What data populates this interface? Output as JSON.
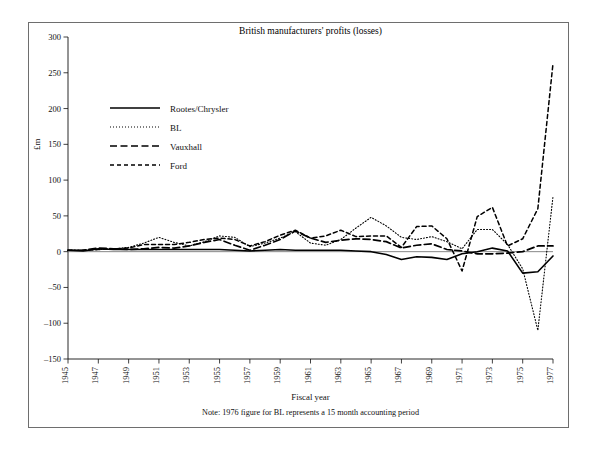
{
  "figure": {
    "border_color": "#6e6e6e",
    "background": "#ffffff"
  },
  "chart_data": {
    "type": "line",
    "title": "British manufacturers' profits (losses)",
    "xlabel": "Fiscal year",
    "ylabel": "£m",
    "note": "Note: 1976 figure for BL represents a 15 month accounting period",
    "grid": false,
    "legend_position": "upper-left",
    "xlim": [
      1945,
      1977
    ],
    "ylim": [
      -150,
      300
    ],
    "ytick_values": [
      300,
      250,
      200,
      150,
      100,
      50,
      0,
      -50,
      -100,
      -150
    ],
    "ytick_labels": [
      "300",
      "250",
      "200",
      "150",
      "100",
      "50",
      "0",
      "–50",
      "–100",
      "–150"
    ],
    "xtick_values": [
      1945,
      1947,
      1949,
      1951,
      1953,
      1955,
      1957,
      1959,
      1961,
      1963,
      1965,
      1967,
      1969,
      1971,
      1973,
      1975,
      1977
    ],
    "xtick_labels": [
      "1945",
      "1947",
      "1949",
      "1951",
      "1953",
      "1955",
      "1957",
      "1959",
      "1961",
      "1963",
      "1965",
      "1967",
      "1969",
      "1971",
      "1973",
      "1975",
      "1977"
    ],
    "x": [
      1945,
      1946,
      1947,
      1948,
      1949,
      1950,
      1951,
      1952,
      1953,
      1954,
      1955,
      1956,
      1957,
      1958,
      1959,
      1960,
      1961,
      1962,
      1963,
      1964,
      1965,
      1966,
      1967,
      1968,
      1969,
      1970,
      1971,
      1972,
      1973,
      1974,
      1975,
      1976,
      1977
    ],
    "series": [
      {
        "name": "Rootes/Chrysler",
        "style": "solid",
        "color": "#000000",
        "values": [
          2,
          1,
          4,
          3,
          3,
          3,
          3,
          3,
          3,
          3,
          3,
          2,
          1,
          2,
          3,
          2,
          2,
          2,
          2,
          1,
          0,
          -4,
          -11,
          -7,
          -8,
          -11,
          -3,
          0,
          5,
          1,
          -30,
          -28,
          -6
        ]
      },
      {
        "name": "BL",
        "style": "dotted",
        "color": "#000000",
        "values": [
          2,
          2,
          3,
          4,
          6,
          12,
          20,
          13,
          8,
          14,
          22,
          20,
          7,
          12,
          19,
          28,
          12,
          9,
          17,
          33,
          48,
          36,
          20,
          17,
          21,
          14,
          4,
          31,
          31,
          10,
          -24,
          -110,
          77
        ]
      },
      {
        "name": "Vauxhall",
        "style": "longdash",
        "color": "#000000",
        "values": [
          2,
          2,
          5,
          4,
          3,
          4,
          6,
          5,
          8,
          13,
          17,
          9,
          2,
          9,
          17,
          29,
          19,
          13,
          16,
          18,
          17,
          14,
          5,
          9,
          11,
          3,
          1,
          -3,
          -3,
          -2,
          0,
          8,
          8
        ]
      },
      {
        "name": "Ford",
        "style": "dashed",
        "color": "#000000",
        "values": [
          2,
          2,
          3,
          4,
          5,
          10,
          10,
          10,
          13,
          17,
          19,
          17,
          8,
          14,
          23,
          30,
          19,
          22,
          30,
          21,
          22,
          22,
          6,
          35,
          36,
          18,
          -27,
          49,
          62,
          8,
          18,
          60,
          263
        ]
      }
    ]
  }
}
